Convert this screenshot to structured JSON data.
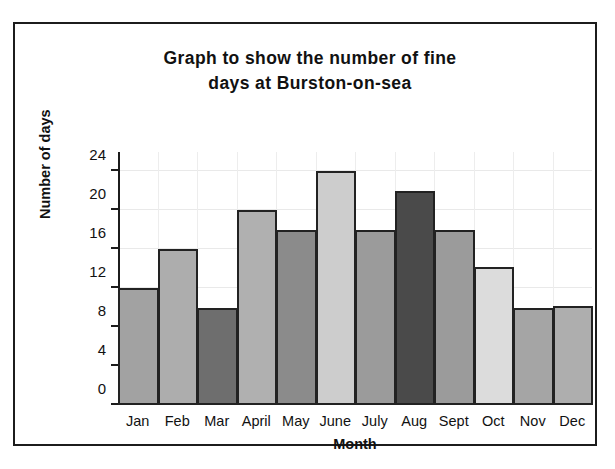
{
  "chart_data": {
    "type": "bar",
    "title": "Graph to show the number of fine\ndays at Burston-on-sea",
    "xlabel": "Month",
    "ylabel": "Number of days",
    "categories": [
      "Jan",
      "Feb",
      "Mar",
      "April",
      "May",
      "June",
      "July",
      "Aug",
      "Sept",
      "Oct",
      "Nov",
      "Dec"
    ],
    "values": [
      12,
      16,
      10,
      20,
      18,
      24,
      18,
      22,
      18,
      14.2,
      10,
      10.2
    ],
    "series": [
      {
        "name": "Number of fine days",
        "values": [
          12,
          16,
          10,
          20,
          18,
          24,
          18,
          22,
          18,
          14.2,
          10,
          10.2
        ]
      }
    ],
    "bar_colors": [
      "#a2a2a2",
      "#adadad",
      "#6e6e6e",
      "#b0b0b0",
      "#8b8b8b",
      "#cdcdcd",
      "#9b9b9b",
      "#4a4a4a",
      "#9b9b9b",
      "#dcdcdc",
      "#a5a5a5",
      "#aeaeae"
    ],
    "bar_border_color": "#222222",
    "ylim": [
      0,
      26
    ],
    "yticks": [
      0,
      4,
      8,
      12,
      16,
      20,
      24
    ],
    "ytick_labels": [
      "0",
      "4",
      "8",
      "12",
      "16",
      "20",
      "24"
    ],
    "grid": true,
    "grid_color": "#e9e9e9",
    "legend": null,
    "axis_color": "#1c1c1c",
    "background": "#ffffff"
  }
}
